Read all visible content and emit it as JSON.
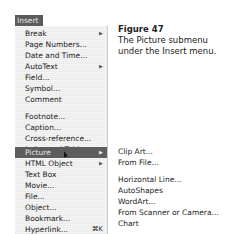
{
  "menu": {
    "title": "Insert",
    "items": [
      {
        "label": "Break",
        "submenu": true
      },
      {
        "label": "Page Numbers..."
      },
      {
        "label": "Date and Time..."
      },
      {
        "label": "AutoText",
        "submenu": true
      },
      {
        "label": "Field..."
      },
      {
        "label": "Symbol..."
      },
      {
        "label": "Comment"
      },
      {
        "label": "Footnote..."
      },
      {
        "label": "Caption..."
      },
      {
        "label": "Cross-reference..."
      },
      {
        "label": "Index and Tables..."
      },
      {
        "label": "Picture",
        "submenu": true,
        "selected": true
      },
      {
        "label": "HTML Object",
        "submenu": true
      },
      {
        "label": "Text Box"
      },
      {
        "label": "Movie..."
      },
      {
        "label": "File..."
      },
      {
        "label": "Object..."
      },
      {
        "label": "Bookmark..."
      },
      {
        "label": "Hyperlink...",
        "shortcut": "⌘K"
      }
    ],
    "arrow": "▶"
  },
  "submenu": {
    "items": [
      "Clip Art...",
      "From File...",
      "Horizontal Line...",
      "AutoShapes",
      "WordArt...",
      "From Scanner or Camera...",
      "Chart"
    ]
  },
  "caption": {
    "figure": "Figure 47",
    "text": "The Picture submenu under the Insert menu."
  }
}
